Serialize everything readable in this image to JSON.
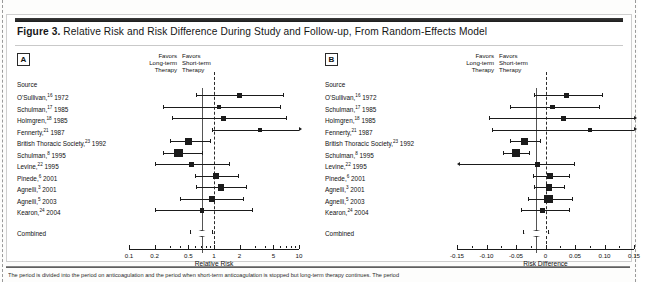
{
  "figure": {
    "label": "Figure 3.",
    "title": "Relative Risk and Risk Difference During Study and Follow-up, From Random-Effects Model",
    "footnote": "The period is divided into the period on anticoagulation and the period when short-term anticoagulation is stopped but long-term therapy continues. The period"
  },
  "sources_header": "Source",
  "combined_label": "Combined",
  "studies": [
    {
      "name": "O'Sullivan,",
      "ref": "16",
      "year": " 1972"
    },
    {
      "name": "Schulman,",
      "ref": "17",
      "year": " 1985"
    },
    {
      "name": "Holmgren,",
      "ref": "18",
      "year": " 1985"
    },
    {
      "name": "Fennerty,",
      "ref": "21",
      "year": " 1987"
    },
    {
      "name": "British Thoracic Society,",
      "ref": "23",
      "year": " 1992"
    },
    {
      "name": "Schulman,",
      "ref": "8",
      "year": " 1995"
    },
    {
      "name": "Levine,",
      "ref": "22",
      "year": " 1995"
    },
    {
      "name": "Pinede,",
      "ref": "6",
      "year": " 2001"
    },
    {
      "name": "Agnelli,",
      "ref": "3",
      "year": " 2001"
    },
    {
      "name": "Agnelli,",
      "ref": "5",
      "year": " 2003"
    },
    {
      "name": "Kearon,",
      "ref": "24",
      "year": " 2004"
    }
  ],
  "panelA": {
    "letter": "A",
    "favors_left": [
      "Favors",
      "Long-term",
      "Therapy"
    ],
    "favors_right": [
      "Favors",
      "Short-term",
      "Therapy"
    ],
    "axis_title": "Relative Risk",
    "tick_labels": [
      "0.1",
      "0.2",
      "0.5",
      "1",
      "2",
      "5",
      "10"
    ]
  },
  "panelB": {
    "letter": "B",
    "favors_left": [
      "Favors",
      "Long-term",
      "Therapy"
    ],
    "favors_right": [
      "Favors",
      "Short-term",
      "Therapy"
    ],
    "axis_title": "Risk Difference",
    "tick_labels": [
      "-0.15",
      "-0.10",
      "-0.05",
      "0",
      "0.05",
      "0.10",
      "0.15"
    ]
  },
  "chart_data": [
    {
      "type": "forest",
      "panel": "A",
      "title": "Relative Risk",
      "xlabel": "Relative Risk",
      "scale": "log",
      "xlim": [
        0.1,
        10
      ],
      "null_value": 1,
      "ticks": [
        0.1,
        0.2,
        0.5,
        1,
        2,
        5,
        10
      ],
      "tick_labels": [
        "0.1",
        "0.2",
        "0.5",
        "1",
        "2",
        "5",
        "10"
      ],
      "favors_left": "Favors Long-term Therapy",
      "favors_right": "Favors Short-term Therapy",
      "categories": [
        "O'Sullivan, 1972",
        "Schulman, 1985",
        "Holmgren, 1985",
        "Fennerty, 1987",
        "British Thoracic Society, 1992",
        "Schulman, 1995",
        "Levine, 1995",
        "Pinede, 2001",
        "Agnelli, 2001",
        "Agnelli, 2003",
        "Kearon, 2004"
      ],
      "estimates": [
        2.0,
        1.15,
        1.3,
        3.5,
        0.5,
        0.38,
        0.55,
        1.05,
        1.2,
        0.95,
        0.72
      ],
      "ci_low": [
        0.62,
        0.25,
        0.32,
        0.95,
        0.3,
        0.25,
        0.2,
        0.6,
        0.62,
        0.4,
        0.2
      ],
      "ci_high": [
        6.5,
        6.0,
        7.0,
        10.0,
        0.9,
        0.72,
        1.5,
        1.9,
        2.4,
        2.2,
        2.8
      ],
      "ci_high_clipped": [
        false,
        false,
        false,
        true,
        false,
        false,
        false,
        false,
        false,
        false,
        false
      ],
      "weights": [
        0.36,
        0.2,
        0.28,
        0.12,
        0.72,
        1.0,
        0.3,
        0.5,
        0.58,
        0.52,
        0.18
      ],
      "combined": {
        "label": "Combined",
        "estimate": 0.72,
        "ci_low": 0.52,
        "ci_high": 0.95
      }
    },
    {
      "type": "forest",
      "panel": "B",
      "title": "Risk Difference",
      "xlabel": "Risk Difference",
      "scale": "linear",
      "xlim": [
        -0.15,
        0.15
      ],
      "null_value": 0,
      "ticks": [
        -0.15,
        -0.1,
        -0.05,
        0,
        0.05,
        0.1,
        0.15
      ],
      "tick_labels": [
        "-0.15",
        "-0.10",
        "-0.05",
        "0",
        "0.05",
        "0.10",
        "0.15"
      ],
      "favors_left": "Favors Long-term Therapy",
      "favors_right": "Favors Short-term Therapy",
      "categories": [
        "O'Sullivan, 1972",
        "Schulman, 1985",
        "Holmgren, 1985",
        "Fennerty, 1987",
        "British Thoracic Society, 1992",
        "Schulman, 1995",
        "Levine, 1995",
        "Pinede, 2001",
        "Agnelli, 2001",
        "Agnelli, 2003",
        "Kearon, 2004"
      ],
      "estimates": [
        0.035,
        0.012,
        0.03,
        0.075,
        -0.035,
        -0.05,
        -0.014,
        0.007,
        0.006,
        0.005,
        -0.005
      ],
      "ci_low": [
        -0.02,
        -0.06,
        -0.095,
        -0.09,
        -0.06,
        -0.072,
        -0.145,
        -0.022,
        -0.02,
        -0.03,
        -0.042
      ],
      "ci_high": [
        0.095,
        0.09,
        0.15,
        0.15,
        -0.01,
        -0.028,
        0.048,
        0.04,
        0.032,
        0.045,
        0.04
      ],
      "ci_high_clipped": [
        false,
        false,
        true,
        true,
        false,
        false,
        false,
        false,
        false,
        false,
        false
      ],
      "ci_low_clipped": [
        false,
        false,
        false,
        false,
        false,
        false,
        true,
        false,
        false,
        false,
        false
      ],
      "weights": [
        0.36,
        0.2,
        0.28,
        0.14,
        0.72,
        0.88,
        0.32,
        0.5,
        0.56,
        1.0,
        0.42
      ],
      "combined": {
        "label": "Combined",
        "estimate": -0.016,
        "ci_low": -0.038,
        "ci_high": 0.004
      }
    }
  ]
}
